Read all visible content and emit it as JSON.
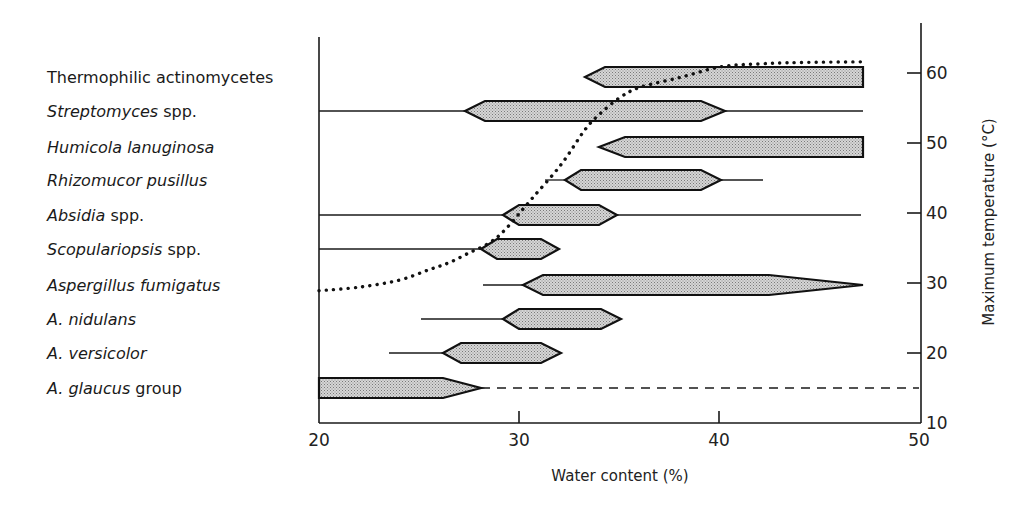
{
  "chart_data": {
    "type": "range-bar-with-line",
    "title": "",
    "xlabel": "Water content (%)",
    "ylabel_right": "Maximum temperature (°C)",
    "xlim": [
      20,
      50
    ],
    "ylim_right": [
      10,
      65
    ],
    "x_ticks": [
      20,
      30,
      40,
      50
    ],
    "y_ticks_right": [
      10,
      20,
      30,
      40,
      50,
      60
    ],
    "grid": false,
    "legend": null,
    "categories": [
      {
        "name": "Thermophilic actinomycetes",
        "italic_part": "",
        "plain_part": "Thermophilic actinomycetes"
      },
      {
        "name": "Streptomyces spp.",
        "italic_part": "Streptomyces",
        "plain_part": " spp."
      },
      {
        "name": "Humicola lanuginosa",
        "italic_part": "Humicola lanuginosa",
        "plain_part": ""
      },
      {
        "name": "Rhizomucor pusillus",
        "italic_part": "Rhizomucor pusillus",
        "plain_part": ""
      },
      {
        "name": "Absidia spp.",
        "italic_part": "Absidia",
        "plain_part": " spp."
      },
      {
        "name": "Scopulariopsis spp.",
        "italic_part": "Scopulariopsis",
        "plain_part": " spp."
      },
      {
        "name": "Aspergillus fumigatus",
        "italic_part": "Aspergillus fumigatus",
        "plain_part": ""
      },
      {
        "name": "A. nidulans",
        "italic_part": "A. nidulans",
        "plain_part": ""
      },
      {
        "name": "A. versicolor",
        "italic_part": "A. versicolor",
        "plain_part": ""
      },
      {
        "name": "A. glaucus group",
        "italic_part": "A. glaucus",
        "plain_part": " group"
      }
    ],
    "ranges": [
      {
        "name": "Thermophilic actinomycetes",
        "line_start": null,
        "bar_start": 33.3,
        "optimum_start": 34.3,
        "optimum_end": 47.2,
        "bar_end": 47.2,
        "line_end": null,
        "right_shape": "flat"
      },
      {
        "name": "Streptomyces spp.",
        "line_start": 20,
        "bar_start": 27.3,
        "optimum_start": 28.3,
        "optimum_end": 39.1,
        "bar_end": 40.3,
        "line_end": 47.2,
        "right_shape": "point"
      },
      {
        "name": "Humicola lanuginosa",
        "line_start": null,
        "bar_start": 34.0,
        "optimum_start": 35.3,
        "optimum_end": 47.2,
        "bar_end": 47.2,
        "line_end": null,
        "right_shape": "flat"
      },
      {
        "name": "Rhizomucor pusillus",
        "line_start": 31.3,
        "bar_start": 32.3,
        "optimum_start": 33.1,
        "optimum_end": 39.1,
        "bar_end": 40.1,
        "line_end": 42.2,
        "right_shape": "point"
      },
      {
        "name": "Absidia spp.",
        "line_start": 20,
        "bar_start": 29.2,
        "optimum_start": 30.0,
        "optimum_end": 34.0,
        "bar_end": 34.9,
        "line_end": 47.1,
        "right_shape": "point"
      },
      {
        "name": "Scopulariopsis spp.",
        "line_start": 20,
        "bar_start": 28.1,
        "optimum_start": 28.9,
        "optimum_end": 31.1,
        "bar_end": 32.0,
        "line_end": null,
        "right_shape": "point"
      },
      {
        "name": "Aspergillus fumigatus",
        "line_start": 28.2,
        "bar_start": 30.2,
        "optimum_start": 31.2,
        "optimum_end": 42.5,
        "bar_end": 47.2,
        "line_end": null,
        "right_shape": "long-taper"
      },
      {
        "name": "A. nidulans",
        "line_start": 25.1,
        "bar_start": 29.2,
        "optimum_start": 30.0,
        "optimum_end": 34.1,
        "bar_end": 35.1,
        "line_end": null,
        "right_shape": "point"
      },
      {
        "name": "A. versicolor",
        "line_start": 23.5,
        "bar_start": 26.2,
        "optimum_start": 27.1,
        "optimum_end": 31.1,
        "bar_end": 32.1,
        "line_end": null,
        "right_shape": "point"
      },
      {
        "name": "A. glaucus group",
        "line_start": null,
        "bar_start": 20,
        "optimum_start": 20,
        "optimum_end": 26.2,
        "bar_end": 28.1,
        "line_end": 50,
        "line_style": "dashed",
        "right_shape": "point"
      }
    ],
    "series": [
      {
        "name": "Maximum temperature (dotted curve)",
        "axis": "right",
        "style": "dotted",
        "x": [
          20,
          22,
          24,
          25.5,
          26.5,
          27.5,
          28.5,
          29.3,
          30.6,
          32.1,
          33.3,
          34.1,
          35.1,
          36.1,
          38.1,
          40.1,
          42,
          44,
          47.2
        ],
        "y": [
          28.9,
          29.4,
          30.4,
          31.9,
          32.9,
          34.3,
          35.7,
          37.6,
          41.9,
          46.9,
          51.9,
          54.3,
          56.6,
          58.0,
          59.4,
          60.9,
          61.3,
          61.5,
          61.6
        ]
      }
    ]
  }
}
